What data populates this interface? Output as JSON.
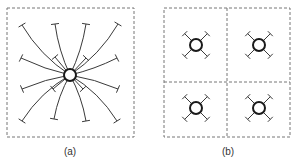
{
  "figure": {
    "panels": [
      {
        "id": "a",
        "label": "(a)",
        "description": "single central node with many radiating connections",
        "frame": {
          "x": 7,
          "y": 8,
          "w": 127,
          "h": 129
        },
        "center": {
          "x": 70,
          "y": 75,
          "r": 6
        },
        "endpoints": [
          {
            "x": 22,
            "y": 25,
            "bend": -8
          },
          {
            "x": 55,
            "y": 24,
            "bend": -4
          },
          {
            "x": 86,
            "y": 24,
            "bend": 4
          },
          {
            "x": 118,
            "y": 24,
            "bend": 8
          },
          {
            "x": 21,
            "y": 58,
            "bend": -3
          },
          {
            "x": 55,
            "y": 57,
            "bend": 0
          },
          {
            "x": 86,
            "y": 58,
            "bend": 0
          },
          {
            "x": 117,
            "y": 58,
            "bend": 3
          },
          {
            "x": 22,
            "y": 89,
            "bend": 3
          },
          {
            "x": 53,
            "y": 89,
            "bend": 0
          },
          {
            "x": 83,
            "y": 89,
            "bend": 0
          },
          {
            "x": 118,
            "y": 89,
            "bend": -3
          },
          {
            "x": 22,
            "y": 121,
            "bend": 8
          },
          {
            "x": 54,
            "y": 119,
            "bend": 4
          },
          {
            "x": 86,
            "y": 121,
            "bend": -4
          },
          {
            "x": 117,
            "y": 121,
            "bend": -8
          }
        ]
      },
      {
        "id": "b",
        "label": "(b)",
        "description": "four cells each with its own local node and four short connections",
        "frame": {
          "x": 164,
          "y": 8,
          "w": 126,
          "h": 129
        },
        "dividers": {
          "x": 227,
          "y": 82
        },
        "cells": [
          {
            "cx": 196,
            "cy": 45,
            "r": 6,
            "arm": 16
          },
          {
            "cx": 259,
            "cy": 45,
            "r": 6,
            "arm": 16
          },
          {
            "cx": 196,
            "cy": 108,
            "r": 6,
            "arm": 16
          },
          {
            "cx": 259,
            "cy": 108,
            "r": 6,
            "arm": 16
          }
        ]
      }
    ]
  },
  "labels": {
    "a": {
      "text": "(a)",
      "x": 70,
      "y": 146
    },
    "b": {
      "text": "(b)",
      "x": 228,
      "y": 146
    }
  },
  "colors": {
    "line": "#3a3a3a",
    "frame": "#777777",
    "node": "#1a1a1a",
    "background": "#ffffff"
  }
}
